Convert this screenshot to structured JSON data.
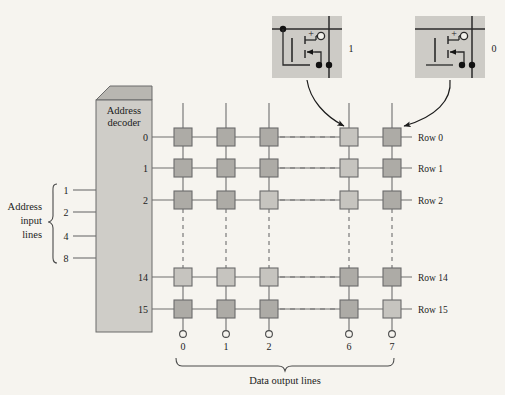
{
  "figure": {
    "background_color": "#f6f4ef",
    "line_color": "#5a5a5a",
    "ink_color": "#1c1c1c"
  },
  "decoder": {
    "title_line1": "Address",
    "title_line2": "decoder",
    "face_color": "#cfcdc8",
    "top_color": "#b8b6b1",
    "side_color": "#c4c2bd",
    "output_labels": [
      "0",
      "1",
      "2",
      "14",
      "15"
    ]
  },
  "address_input": {
    "label_line1": "Address",
    "label_line2": "input",
    "label_line3": "lines",
    "weights": [
      "1",
      "2",
      "4",
      "8"
    ]
  },
  "matrix": {
    "row_labels": [
      "Row 0",
      "Row 1",
      "Row 2",
      "Row 14",
      "Row 15"
    ],
    "column_labels": [
      "0",
      "1",
      "2",
      "6",
      "7"
    ],
    "cell_fill_dark": "#adaba6",
    "cell_fill_light": "#c6c4bf",
    "cell_border": "#6b6b6b",
    "cells": [
      [
        "dark",
        "dark",
        "dark",
        "light",
        "dark"
      ],
      [
        "dark",
        "dark",
        "dark",
        "light",
        "dark"
      ],
      [
        "dark",
        "dark",
        "light",
        "light",
        "dark"
      ],
      [
        "light",
        "light",
        "light",
        "dark",
        "dark"
      ],
      [
        "dark",
        "dark",
        "dark",
        "dark",
        "light"
      ]
    ]
  },
  "output_brace": {
    "caption": "Data output lines"
  },
  "insets": [
    {
      "name": "cell-storing-one",
      "value_label": "1",
      "charged": true,
      "plus_sign": "+",
      "box_fill": "#cdcbc6"
    },
    {
      "name": "cell-storing-zero",
      "value_label": "0",
      "charged": false,
      "plus_sign": "+",
      "box_fill": "#cdcbc6"
    }
  ]
}
